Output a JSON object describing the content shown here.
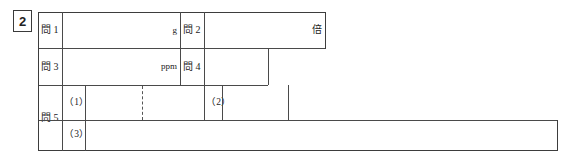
{
  "sheet": {
    "question_number": "2",
    "rows": [
      {
        "id": "row-1",
        "cells": [
          {
            "name": "label-mon-1",
            "text": "問 1"
          },
          {
            "name": "answer-mon-1",
            "unit": "g",
            "value": ""
          },
          {
            "name": "label-mon-2",
            "text": "問 2"
          },
          {
            "name": "answer-mon-2",
            "unit": "倍",
            "value": ""
          }
        ]
      },
      {
        "id": "row-2",
        "cells": [
          {
            "name": "label-mon-3",
            "text": "問 3"
          },
          {
            "name": "answer-mon-3",
            "unit": "ppm",
            "value": ""
          },
          {
            "name": "label-mon-4",
            "text": "問 4"
          },
          {
            "name": "answer-mon-4",
            "unit": "",
            "value": ""
          }
        ]
      },
      {
        "id": "row-3",
        "cells": [
          {
            "name": "label-mon-5",
            "text": "問 5"
          },
          {
            "name": "label-sub-1",
            "text": "（1）"
          },
          {
            "name": "answer-sub-1",
            "unit": "",
            "value": ""
          },
          {
            "name": "label-sub-2",
            "text": "（2）"
          },
          {
            "name": "answer-sub-2",
            "unit": "",
            "value": ""
          }
        ]
      },
      {
        "id": "row-4",
        "cells": [
          {
            "name": "label-sub-3",
            "text": "（3）"
          },
          {
            "name": "answer-sub-3",
            "unit": "",
            "value": ""
          }
        ]
      }
    ],
    "labels": {
      "mon1": "問 1",
      "mon2": "問 2",
      "mon3": "問 3",
      "mon4": "問 4",
      "mon5": "問 5",
      "sub1": "（1）",
      "sub2": "（2）",
      "sub3": "（3）"
    },
    "units": {
      "mon1": "g",
      "mon2": "倍",
      "mon3": "ppm",
      "mon4": "",
      "sub1": "",
      "sub2": "",
      "sub3": ""
    },
    "answers": {
      "mon1": "",
      "mon2": "",
      "mon3": "",
      "mon4": "",
      "sub1": "",
      "sub2": "",
      "sub3": ""
    },
    "colors": {
      "rule": "#4a4a4a",
      "rule_strong": "#3d3d3d",
      "text": "#1d1d1d",
      "paper": "#ffffff"
    }
  }
}
